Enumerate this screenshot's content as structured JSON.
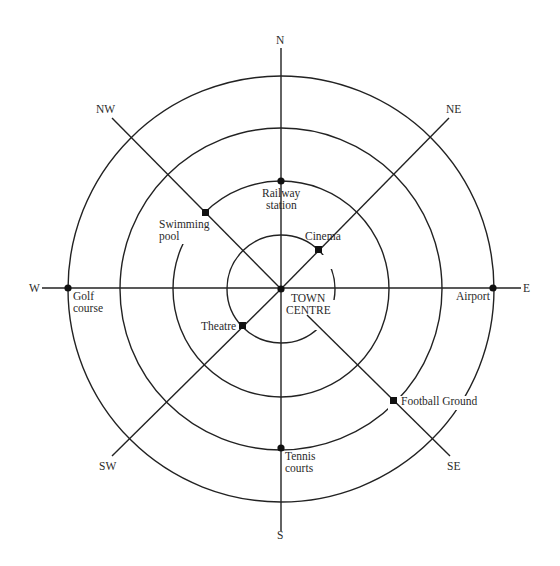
{
  "diagram": {
    "centre": {
      "x": 281,
      "y": 289
    },
    "rings": [
      54,
      108,
      161,
      213
    ],
    "compass": {
      "N": "N",
      "NE": "NE",
      "E": "E",
      "SE": "SE",
      "S": "S",
      "SW": "SW",
      "W": "W",
      "NW": "NW"
    },
    "places": {
      "railway_station": {
        "line1": "Railway",
        "line2": "station",
        "direction": "N",
        "ring": 3
      },
      "cinema": {
        "label": "Cinema",
        "direction": "NE",
        "ring": 1
      },
      "swimming_pool": {
        "line1": "Swimming",
        "line2": "pool",
        "direction": "NW",
        "ring": 2
      },
      "golf_course": {
        "line1": "Golf",
        "line2": "course",
        "direction": "W",
        "ring": 4
      },
      "airport": {
        "label": "Airport",
        "direction": "E",
        "ring": 4
      },
      "town_centre": {
        "line1": "TOWN",
        "line2": "CENTRE",
        "direction": "centre",
        "ring": 0
      },
      "theatre": {
        "label": "Theatre",
        "direction": "SW",
        "ring": 1
      },
      "football_ground": {
        "label": "Football Ground",
        "direction": "SE",
        "ring": 3
      },
      "tennis_courts": {
        "line1": "Tennis",
        "line2": "courts",
        "direction": "S",
        "ring": 3
      }
    }
  }
}
